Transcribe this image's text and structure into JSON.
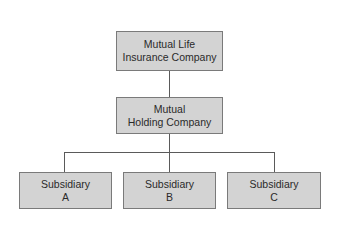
{
  "diagram": {
    "colors": {
      "box_fill": "#d3d3d3",
      "box_border": "#7a7a7a",
      "line": "#5a5a5a",
      "text": "#2a2a2a"
    },
    "nodes": [
      {
        "id": "mutual-life",
        "line1": "Mutual Life",
        "line2": "Insurance Company"
      },
      {
        "id": "holding",
        "line1": "Mutual",
        "line2": "Holding Company"
      },
      {
        "id": "sub-a",
        "line1": "Subsidiary",
        "line2": "A"
      },
      {
        "id": "sub-b",
        "line1": "Subsidiary",
        "line2": "B"
      },
      {
        "id": "sub-c",
        "line1": "Subsidiary",
        "line2": "C"
      }
    ],
    "edges": [
      {
        "from": "mutual-life",
        "to": "holding"
      },
      {
        "from": "holding",
        "to": "sub-a"
      },
      {
        "from": "holding",
        "to": "sub-b"
      },
      {
        "from": "holding",
        "to": "sub-c"
      }
    ]
  }
}
